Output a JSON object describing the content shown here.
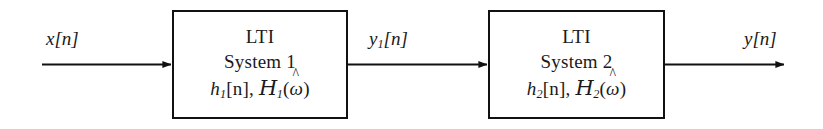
{
  "diagram": {
    "background_color": "#ffffff",
    "line_color": "#111111"
  },
  "signals": {
    "input": {
      "name": "x[n]",
      "base": "x",
      "index": "[n]"
    },
    "intermediate": {
      "name": "y1[n]",
      "base": "y",
      "subscript": "1",
      "index": "[n]"
    },
    "output": {
      "name": "y[n]",
      "base": "y",
      "index": "[n]"
    }
  },
  "blocks": [
    {
      "id": "block-1",
      "line1": "LTI",
      "line2": "System 1",
      "impulse_response": "h",
      "impulse_subscript": "1",
      "impulse_index": "[n]",
      "separator": ", ",
      "frequency_response": "H",
      "frequency_subscript": "1",
      "frequency_arg_open": "(",
      "frequency_arg": "ω",
      "frequency_arg_close": ")",
      "math_plain": "h1[n], H1(ω̂)"
    },
    {
      "id": "block-2",
      "line1": "LTI",
      "line2": "System 2",
      "impulse_response": "h",
      "impulse_subscript": "2",
      "impulse_index": "[n]",
      "separator": ", ",
      "frequency_response": "H",
      "frequency_subscript": "2",
      "frequency_arg_open": "(",
      "frequency_arg": "ω",
      "frequency_arg_close": ")",
      "math_plain": "h2[n], H2(ω̂)"
    }
  ],
  "connectors": [
    {
      "id": "input-arrow",
      "from": "x[n] source",
      "to": "LTI System 1"
    },
    {
      "id": "intermediate-arrow",
      "from": "LTI System 1",
      "to": "LTI System 2"
    },
    {
      "id": "output-arrow",
      "from": "LTI System 2",
      "to": "y[n] sink"
    }
  ]
}
